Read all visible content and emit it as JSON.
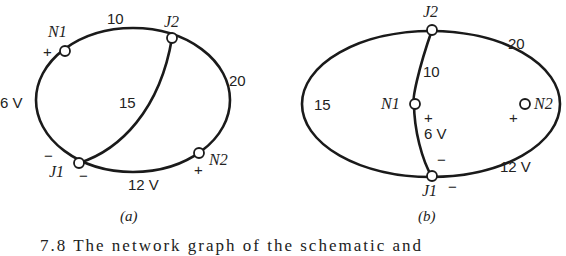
{
  "figure_a": {
    "label": "(a)",
    "nodes": {
      "N1": "N1",
      "J2": "J2",
      "J1": "J1",
      "N2": "N2"
    },
    "branches": {
      "top": "10",
      "right": "20",
      "chord": "15",
      "left_source": "6 V",
      "bottom_source": "12 V"
    },
    "signs": {
      "n1_plus": "+",
      "j1_minus_left": "−",
      "j1_minus_bottom": "−",
      "n2_plus": "+"
    }
  },
  "figure_b": {
    "label": "(b)",
    "nodes": {
      "J2": "J2",
      "N1": "N1",
      "N2": "N2",
      "J1": "J1"
    },
    "branches": {
      "left": "15",
      "center_top": "10",
      "right_top": "20",
      "center_source": "6 V",
      "bottom_right_source": "12 V"
    },
    "signs": {
      "n1_plus": "+",
      "center_minus": "−",
      "n2_plus": "+",
      "j1_minus": "−"
    }
  },
  "caption": "7.8   The network graph of the schematic and"
}
